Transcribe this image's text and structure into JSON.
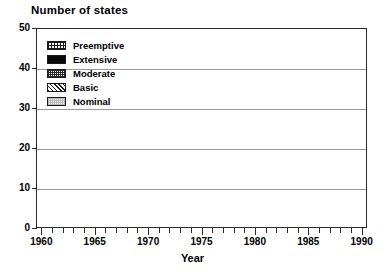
{
  "chart_data": {
    "type": "bar",
    "subtype": "stacked-bar",
    "title": "Number of states",
    "xlabel": "Year",
    "ylabel": "Number of states",
    "ylim": [
      0,
      50
    ],
    "yticks": [
      0,
      10,
      20,
      30,
      40,
      50
    ],
    "xlim": [
      1959.5,
      1990.5
    ],
    "xticks": [
      1960,
      1961,
      1962,
      1963,
      1964,
      1965,
      1966,
      1967,
      1968,
      1969,
      1970,
      1971,
      1972,
      1973,
      1974,
      1975,
      1976,
      1977,
      1978,
      1979,
      1980,
      1981,
      1982,
      1983,
      1984,
      1985,
      1986,
      1987,
      1988,
      1989,
      1990
    ],
    "xtick_labels": [
      "1960",
      "1965",
      "1970",
      "1975",
      "1980",
      "1985",
      "1990"
    ],
    "labeled_xticks": [
      1960,
      1965,
      1970,
      1975,
      1980,
      1985,
      1990
    ],
    "grid": true,
    "grid_axis": "y",
    "legend_position": "upper-left-inside",
    "categories": [
      1960,
      1961,
      1962,
      1963,
      1964,
      1965,
      1966,
      1967,
      1968,
      1969,
      1970,
      1971,
      1972,
      1973,
      1974,
      1975,
      1976,
      1977,
      1978,
      1979,
      1980,
      1981,
      1982,
      1983,
      1984,
      1985,
      1986,
      1987,
      1988,
      1989,
      1990
    ],
    "series": [
      {
        "name": "Nominal",
        "pattern": "light-dotted",
        "values": [
          13,
          0,
          0,
          0,
          13,
          0,
          0,
          0,
          0,
          0,
          15,
          17,
          18,
          19,
          21,
          23,
          19,
          17,
          17,
          13,
          13,
          11,
          11,
          11,
          10,
          10,
          9,
          9,
          8,
          8,
          7
        ]
      },
      {
        "name": "Basic",
        "pattern": "diagonal-hatch",
        "values": [
          0,
          0,
          0,
          0,
          0,
          0,
          0,
          0,
          0,
          0,
          0,
          0,
          0,
          0,
          1,
          2,
          8,
          12,
          14,
          19,
          20,
          22,
          22,
          23,
          24,
          24,
          24,
          24,
          25,
          25,
          23
        ]
      },
      {
        "name": "Moderate",
        "pattern": "dense-speckle",
        "values": [
          0,
          0,
          0,
          0,
          0,
          0,
          0,
          0,
          0,
          0,
          0,
          0,
          0,
          0,
          0,
          0,
          2,
          2,
          3,
          4,
          5,
          5,
          6,
          6,
          6,
          6,
          6,
          6,
          6,
          6,
          6
        ]
      },
      {
        "name": "Extensive",
        "pattern": "solid-black",
        "values": [
          0,
          0,
          0,
          0,
          0,
          0,
          0,
          0,
          0,
          0,
          0,
          0,
          0,
          0,
          0,
          0,
          1,
          2,
          3,
          3,
          3,
          3,
          3,
          4,
          4,
          6,
          6,
          7,
          7,
          8,
          8
        ]
      },
      {
        "name": "Preemptive",
        "pattern": "fine-grid",
        "values": [
          0,
          0,
          0,
          0,
          0,
          0,
          0,
          0,
          0,
          0,
          0,
          0,
          0,
          0,
          0,
          0,
          0,
          0,
          0,
          0,
          0,
          0,
          0,
          0,
          0,
          0,
          0,
          0,
          0,
          0,
          2
        ]
      }
    ],
    "totals": [
      13,
      0,
      0,
      0,
      13,
      0,
      0,
      0,
      0,
      0,
      15,
      17,
      18,
      19,
      22,
      25,
      30,
      33,
      37,
      39,
      41,
      41,
      42,
      44,
      44,
      46,
      45,
      46,
      46,
      47,
      46
    ]
  },
  "legend": {
    "items": [
      {
        "label": "Preemptive",
        "pattern": "fine-grid"
      },
      {
        "label": "Extensive",
        "pattern": "solid-black"
      },
      {
        "label": "Moderate",
        "pattern": "dense-speckle"
      },
      {
        "label": "Basic",
        "pattern": "diagonal-hatch"
      },
      {
        "label": "Nominal",
        "pattern": "light-dotted"
      }
    ]
  },
  "colors": {
    "axis": "#2b2b2b",
    "grid": "#9a9a9a",
    "background": "#ffffff",
    "ink": "#000000"
  }
}
